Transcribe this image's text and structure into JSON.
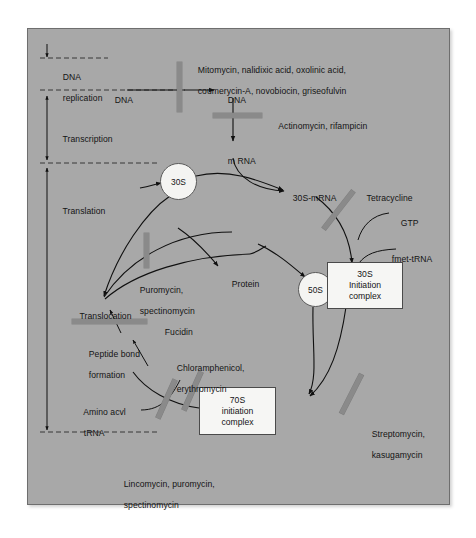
{
  "figure": {
    "background_color": "#a8a8a8",
    "panel_border_color": "#6e6e6e",
    "text_color": "#141414",
    "inhibitor_bar_color": "#8a8a8a",
    "node_fill_color": "#f4f4f2"
  },
  "stages": [
    {
      "id": "dna-replication",
      "label_line1": "DNA",
      "label_line2": "replication"
    },
    {
      "id": "transcription",
      "label_line1": "Transcription",
      "label_line2": ""
    },
    {
      "id": "translation",
      "label_line1": "Translation",
      "label_line2": ""
    }
  ],
  "molecules": {
    "dna_left": "DNA",
    "dna_right": "DNA",
    "mrna": "m RNA",
    "s30_mrna": "30S-mRNA",
    "gtp": "GTP",
    "fmet_trna": "fmet-tRNA",
    "protein": "Protein",
    "translocation": "Translocation",
    "peptide_bond_line1": "Peptide bond",
    "peptide_bond_line2": "formation",
    "amino_acyl_line1": "Amino acvl",
    "amino_acyl_line2": "tRNA"
  },
  "nodes": {
    "s30": {
      "label": "30S"
    },
    "s50": {
      "label": "50S"
    },
    "s30_initiation": {
      "line1": "30S",
      "line2": "Initiation",
      "line3": "complex"
    },
    "s70_initiation": {
      "line1": "70S",
      "line2": "initiation",
      "line3": "complex"
    }
  },
  "inhibitors": [
    {
      "id": "dna-replication-inhibitors",
      "line1": "Mitomycin, nalidixic acid, oxolinic acid,",
      "line2": "coumerycin-A, novobiocin, griseofulvin",
      "orientation": "vertical"
    },
    {
      "id": "transcription-inhibitors",
      "line1": "Actinomycin, rifampicin",
      "line2": "",
      "orientation": "horizontal"
    },
    {
      "id": "tetracycline",
      "line1": "Tetracycline",
      "line2": "",
      "orientation": "diagonal"
    },
    {
      "id": "puromycin-spectinomycin",
      "line1": "Puromycin,",
      "line2": "spectinomycin",
      "orientation": "vertical"
    },
    {
      "id": "fucidin",
      "line1": "Fucidin",
      "line2": "",
      "orientation": "horizontal"
    },
    {
      "id": "chloramphenicol-erythromycin",
      "line1": "Chloramphenicol,",
      "line2": "erythromycin",
      "orientation": "diagonal"
    },
    {
      "id": "lincomycin-puromycin-spectinomycin",
      "line1": "Lincomycin, puromycin,",
      "line2": "spectinomycin",
      "orientation": "diagonal"
    },
    {
      "id": "streptomycin-kasugamycin",
      "line1": "Streptomycin,",
      "line2": "kasugamycin",
      "orientation": "diagonal"
    }
  ]
}
